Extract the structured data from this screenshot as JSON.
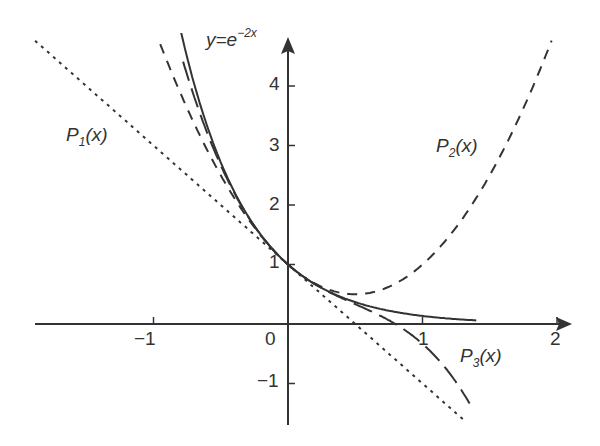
{
  "chart_data": {
    "type": "line",
    "title": "",
    "xlabel": "",
    "ylabel": "",
    "xlim": [
      -1.9,
      2.05
    ],
    "ylim": [
      -1.6,
      4.9
    ],
    "grid": false,
    "x_ticks": [
      -1,
      0,
      1,
      2
    ],
    "x_tick_labels": [
      "−1",
      "0",
      "1",
      "2"
    ],
    "y_ticks": [
      -1,
      1,
      2,
      3,
      4
    ],
    "y_tick_labels": [
      "−1",
      "1",
      "2",
      "3",
      "4"
    ],
    "series": [
      {
        "name": "y=e^{-2x}",
        "style": "solid",
        "formula": "e^(-2x)",
        "x": [
          -0.8,
          -0.6,
          -0.4,
          -0.2,
          0,
          0.2,
          0.4,
          0.6,
          0.8,
          1.0,
          1.2,
          1.4
        ],
        "values": [
          4.95,
          3.32,
          2.23,
          1.49,
          1.0,
          0.67,
          0.45,
          0.3,
          0.2,
          0.14,
          0.09,
          0.06
        ]
      },
      {
        "name": "P1(x)",
        "style": "dotted",
        "formula": "1-2x",
        "x": [
          -1.88,
          -1,
          0,
          1,
          1.3
        ],
        "values": [
          4.76,
          3,
          1,
          -1,
          -1.6
        ]
      },
      {
        "name": "P2(x)",
        "style": "dashed",
        "formula": "1-2x+2x^2",
        "x": [
          -0.95,
          -0.5,
          0,
          0.5,
          1,
          1.5,
          1.96
        ],
        "values": [
          4.71,
          2.5,
          1,
          0.5,
          1,
          2.5,
          4.76
        ]
      },
      {
        "name": "P3(x)",
        "style": "long-dashed",
        "formula": "1-2x+2x^2-(4/3)x^3",
        "x": [
          -0.78,
          -0.5,
          0,
          0.5,
          1,
          1.35
        ],
        "values": [
          4.77,
          2.67,
          1,
          0.33,
          -0.33,
          -1.58
        ]
      }
    ],
    "annotations": [
      {
        "text": "y=e^{-2x}",
        "near": [
          -0.5,
          4.7
        ]
      },
      {
        "text": "P1(x)",
        "near": [
          -1.7,
          2.9
        ]
      },
      {
        "text": "P2(x)",
        "near": [
          1.15,
          2.9
        ]
      },
      {
        "text": "P3(x)",
        "near": [
          1.25,
          -0.5
        ]
      }
    ]
  },
  "labels": {
    "curve_main": "y=e",
    "curve_main_exp": "−2x",
    "p1": "P",
    "p1_sub": "1",
    "p2": "P",
    "p2_sub": "2",
    "p3": "P",
    "p3_sub": "3",
    "arg": "(x)"
  },
  "ticks": {
    "x": [
      "−1",
      "0",
      "1",
      "2"
    ],
    "y": [
      "4",
      "3",
      "2",
      "1",
      "−1"
    ]
  }
}
